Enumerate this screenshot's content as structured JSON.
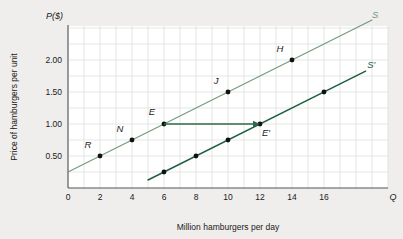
{
  "figure": {
    "background_color": "#efeeec",
    "plot_background_color": "#ffffff",
    "grid_color": "#d8dcd8"
  },
  "chart_data": {
    "type": "line",
    "title": "",
    "subtitle": "",
    "xlabel": "Million hamburgers per day",
    "ylabel": "Price of hamburgers per unit",
    "x_axis_variable": "Q",
    "y_axis_variable": "P($)",
    "xlim": [
      0,
      20
    ],
    "ylim": [
      0,
      2.5
    ],
    "xticks": [
      0,
      2,
      4,
      6,
      8,
      10,
      12,
      14,
      16
    ],
    "xtick_labels": [
      "0",
      "2",
      "4",
      "6",
      "8",
      "10",
      "12",
      "14",
      "16"
    ],
    "yticks": [
      0.5,
      1.0,
      1.5,
      2.0
    ],
    "ytick_labels": [
      "0.50",
      "1.00",
      "1.50",
      "2.00"
    ],
    "grid": true,
    "legend": "none",
    "series": [
      {
        "name": "S",
        "label": "S",
        "color": "#6f9a7e",
        "line_width": 1.1,
        "x_start": 0,
        "y_start": 0.25,
        "x_end": 19,
        "y_end": 2.625,
        "slope": 0.125,
        "intercept": 0.25,
        "label_x": 19.0,
        "label_y": 2.66,
        "points": [
          {
            "label": "R",
            "x": 2,
            "y": 0.5,
            "label_dx": -12,
            "label_dy": -8
          },
          {
            "label": "N",
            "x": 4,
            "y": 0.75,
            "label_dx": -12,
            "label_dy": -8
          },
          {
            "label": "E",
            "x": 6,
            "y": 1.0,
            "label_dx": -12,
            "label_dy": -9
          },
          {
            "label": "J",
            "x": 10,
            "y": 1.5,
            "label_dx": -12,
            "label_dy": -8
          },
          {
            "label": "H",
            "x": 14,
            "y": 2.0,
            "label_dx": -12,
            "label_dy": -8
          }
        ]
      },
      {
        "name": "S'",
        "label": "S′",
        "color": "#1f5f40",
        "line_width": 1.5,
        "x_start": 5,
        "y_start": 0.125,
        "x_end": 18.6,
        "y_end": 1.825,
        "slope": 0.125,
        "intercept": -0.5,
        "label_x": 18.7,
        "label_y": 1.88,
        "points": [
          {
            "label": "",
            "x": 6,
            "y": 0.25,
            "label_dx": 0,
            "label_dy": 0
          },
          {
            "label": "",
            "x": 8,
            "y": 0.5,
            "label_dx": 0,
            "label_dy": 0
          },
          {
            "label": "",
            "x": 10,
            "y": 0.75,
            "label_dx": 0,
            "label_dy": 0
          },
          {
            "label": "E′",
            "x": 12,
            "y": 1.0,
            "label_dx": 6,
            "label_dy": 12
          },
          {
            "label": "",
            "x": 16,
            "y": 1.5,
            "label_dx": 0,
            "label_dy": 0
          }
        ]
      }
    ],
    "annotations": [
      {
        "type": "arrow",
        "name": "shift-arrow-E-to-Eprime",
        "from_x": 6,
        "from_y": 1.0,
        "to_x": 12,
        "to_y": 1.0,
        "color": "#2c6b4a"
      }
    ]
  }
}
